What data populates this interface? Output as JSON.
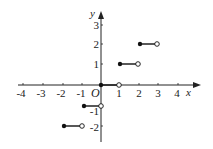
{
  "diagram": {
    "type": "step-function-graph",
    "axes": {
      "x_label": "x",
      "y_label": "y",
      "origin_label": "O",
      "x_ticks": [
        "-4",
        "-3",
        "-2",
        "-1",
        "1",
        "2",
        "3",
        "4"
      ],
      "y_ticks": [
        "3",
        "2",
        "1",
        "-1",
        "-2"
      ]
    },
    "segments": [
      {
        "y": -2,
        "x_start": -2,
        "x_end": -1,
        "start": "closed",
        "end": "open"
      },
      {
        "y": -1,
        "x_start": -1,
        "x_end": 0,
        "start": "closed",
        "end": "open"
      },
      {
        "y": 0,
        "x_start": 0,
        "x_end": 1,
        "start": "closed",
        "end": "open"
      },
      {
        "y": 1,
        "x_start": 1,
        "x_end": 2,
        "start": "closed",
        "end": "open"
      },
      {
        "y": 2,
        "x_start": 2,
        "x_end": 3,
        "start": "closed",
        "end": "open"
      }
    ]
  }
}
